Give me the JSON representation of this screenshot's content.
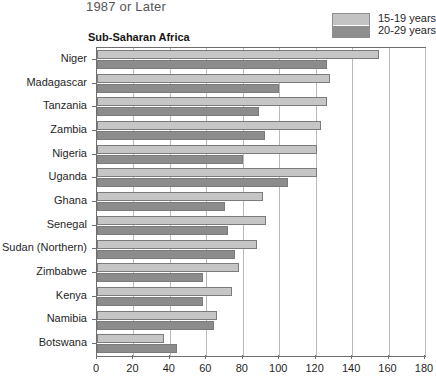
{
  "header": {
    "title": "1987 or Later",
    "region_label": "Sub-Saharan Africa"
  },
  "legend": {
    "position": "top-right",
    "entries": [
      {
        "label": "15-19 years",
        "color": "#c6c6c6",
        "swatch_name": "legend-swatch-light"
      },
      {
        "label": "20-29 years",
        "color": "#8c8c8c",
        "swatch_name": "legend-swatch-dark"
      }
    ]
  },
  "chart_data": {
    "type": "bar",
    "orientation": "horizontal",
    "title": "1987 or Later",
    "subtitle": "Sub-Saharan Africa",
    "xlabel": "",
    "ylabel": "",
    "xlim": [
      0,
      180
    ],
    "xticks": [
      0,
      20,
      40,
      60,
      80,
      100,
      120,
      140,
      160,
      180
    ],
    "grid": "vertical",
    "categories": [
      "Niger",
      "Madagascar",
      "Tanzania",
      "Zambia",
      "Nigeria",
      "Uganda",
      "Ghana",
      "Senegal",
      "Sudan (Northern)",
      "Zimbabwe",
      "Kenya",
      "Namibia",
      "Botswana"
    ],
    "series": [
      {
        "name": "15-19 years",
        "color": "#c6c6c6",
        "values": [
          155,
          128,
          126,
          123,
          121,
          121,
          91,
          93,
          88,
          78,
          74,
          66,
          37
        ]
      },
      {
        "name": "20-29 years",
        "color": "#8c8c8c",
        "values": [
          126,
          100,
          89,
          92,
          80,
          105,
          70,
          72,
          76,
          58,
          58,
          64,
          44
        ]
      }
    ]
  }
}
